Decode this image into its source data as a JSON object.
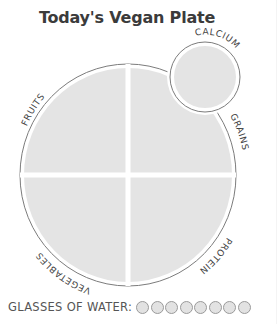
{
  "title": "Today's Vegan Plate",
  "plate": {
    "sections": [
      {
        "id": "fruits",
        "label": "FRUITS"
      },
      {
        "id": "grains",
        "label": "GRAINS"
      },
      {
        "id": "protein",
        "label": "PROTEIN"
      },
      {
        "id": "vegetables",
        "label": "VEGETABLES"
      }
    ],
    "side": {
      "id": "calcium",
      "label": "CALCIUM"
    }
  },
  "water": {
    "label": "GLASSES OF WATER:",
    "glasses": 8
  },
  "colors": {
    "fill": "#e4e4e4",
    "outline": "#808080",
    "text": "#3b3b3b"
  }
}
